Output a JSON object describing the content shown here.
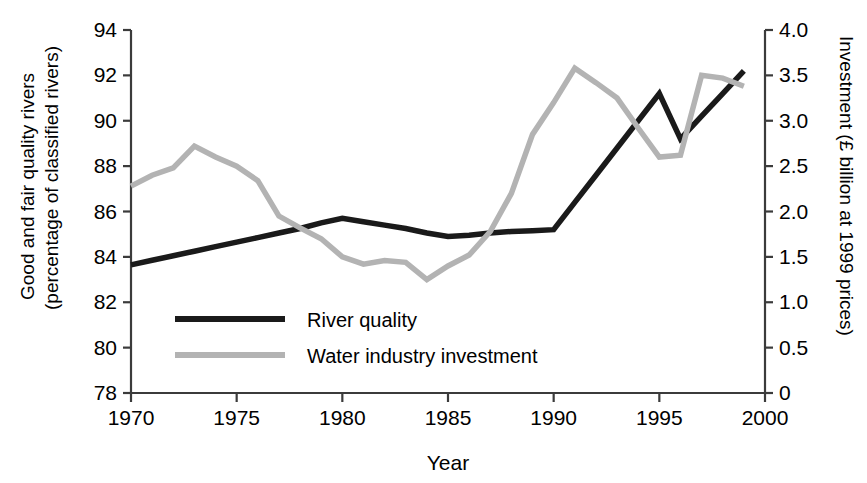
{
  "chart_data": {
    "type": "line",
    "title": "",
    "xlabel": "Year",
    "ylabel": "Good and fair quality rivers (percentage of classified rivers)",
    "y2label": "Investment (£ billion at 1999 prices)",
    "xlim": [
      1970,
      2000
    ],
    "ylim": [
      78,
      94
    ],
    "y2lim": [
      0,
      4.0
    ],
    "grid": false,
    "legend_position": "inside-lower-left",
    "xticks": [
      1970,
      1975,
      1980,
      1985,
      1990,
      1995,
      2000
    ],
    "xtick_labels": [
      "1970",
      "1975",
      "1980",
      "1985",
      "1990",
      "1995",
      "2000"
    ],
    "yticks": [
      78,
      80,
      82,
      84,
      86,
      88,
      90,
      92,
      94
    ],
    "ytick_labels": [
      "78",
      "80",
      "82",
      "84",
      "86",
      "88",
      "90",
      "92",
      "94"
    ],
    "y2ticks": [
      0,
      0.5,
      1.0,
      1.5,
      2.0,
      2.5,
      3.0,
      3.5,
      4.0
    ],
    "y2tick_labels": [
      "0",
      "0.5",
      "1.0",
      "1.5",
      "2.0",
      "2.5",
      "3.0",
      "3.5",
      "4.0"
    ],
    "series": [
      {
        "name": "River quality",
        "axis": "left",
        "color": "#1a1a1a",
        "width": 5.5,
        "x": [
          1970,
          1971,
          1972,
          1973,
          1974,
          1975,
          1976,
          1977,
          1978,
          1979,
          1980,
          1981,
          1982,
          1983,
          1984,
          1985,
          1986,
          1987,
          1988,
          1989,
          1990,
          1991,
          1992,
          1993,
          1994,
          1995,
          1996,
          1997,
          1998,
          1999
        ],
        "values": [
          83.65,
          83.85,
          84.05,
          84.25,
          84.45,
          84.65,
          84.85,
          85.05,
          85.25,
          85.5,
          85.7,
          85.55,
          85.4,
          85.25,
          85.05,
          84.9,
          84.95,
          85.05,
          85.12,
          85.15,
          85.2,
          86.4,
          87.6,
          88.8,
          90.0,
          91.2,
          89.2,
          90.2,
          91.2,
          92.2
        ]
      },
      {
        "name": "Water industry investment",
        "axis": "right",
        "color": "#b3b3b3",
        "width": 5.5,
        "x": [
          1970,
          1971,
          1972,
          1973,
          1974,
          1975,
          1976,
          1977,
          1978,
          1979,
          1980,
          1981,
          1982,
          1983,
          1984,
          1985,
          1986,
          1987,
          1988,
          1989,
          1990,
          1991,
          1992,
          1993,
          1994,
          1995,
          1996,
          1997,
          1998,
          1999
        ],
        "values": [
          2.28,
          2.4,
          2.48,
          2.72,
          2.6,
          2.5,
          2.34,
          1.95,
          1.82,
          1.7,
          1.5,
          1.42,
          1.46,
          1.44,
          1.25,
          1.4,
          1.52,
          1.78,
          2.2,
          2.85,
          3.2,
          3.58,
          3.42,
          3.25,
          2.92,
          2.6,
          2.62,
          3.5,
          3.47,
          3.38
        ]
      }
    ]
  },
  "axes": {
    "x_title": "Year",
    "y_left_title_line1": "Good and fair quality rivers",
    "y_left_title_line2": "(percentage of classified rivers)",
    "y_right_title": "Investment (£ billion at 1999 prices)"
  },
  "legend": {
    "entries": [
      {
        "label": "River quality",
        "color": "#1a1a1a"
      },
      {
        "label": "Water industry investment",
        "color": "#b3b3b3"
      }
    ]
  }
}
